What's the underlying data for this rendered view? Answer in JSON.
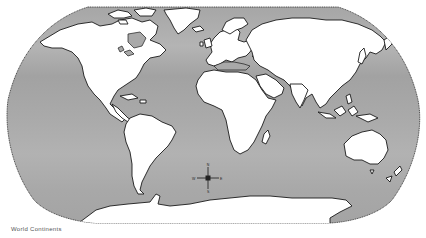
{
  "map": {
    "projection": "Robinson",
    "style": "outline",
    "colors": {
      "ocean": "#a9a9a9",
      "ocean_band": "#bcbcbc",
      "land": "#ffffff",
      "coastline": "#1a1a1a",
      "background": "#ffffff"
    },
    "regions": [
      {
        "name": "North America"
      },
      {
        "name": "Greenland"
      },
      {
        "name": "South America"
      },
      {
        "name": "Europe"
      },
      {
        "name": "Africa"
      },
      {
        "name": "Asia"
      },
      {
        "name": "Australia"
      },
      {
        "name": "Antarctica"
      },
      {
        "name": "Madagascar"
      },
      {
        "name": "New Zealand"
      }
    ],
    "compass": {
      "north": "N",
      "south": "S",
      "east": "E",
      "west": "W"
    }
  },
  "caption": {
    "text": "World Continents"
  }
}
